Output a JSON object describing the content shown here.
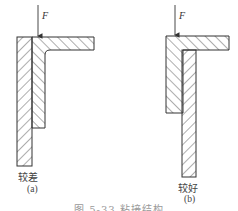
{
  "figure": {
    "caption": "图 5-33  粘接结构",
    "stroke_color": "#333333",
    "background": "#ffffff",
    "panels": [
      {
        "id": "a",
        "label": "(a)",
        "quality": "较差",
        "force_label": "F"
      },
      {
        "id": "b",
        "label": "(b)",
        "quality": "较好",
        "force_label": "F"
      }
    ]
  }
}
